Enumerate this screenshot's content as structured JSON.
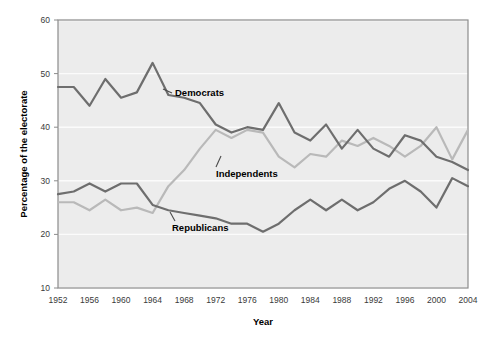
{
  "chart_data": {
    "type": "line",
    "title": "",
    "xlabel": "Year",
    "ylabel": "Percentage of the electorate",
    "xlim": [
      1952,
      2004
    ],
    "ylim": [
      10,
      60
    ],
    "yticks": [
      10,
      20,
      30,
      40,
      50,
      60
    ],
    "xticks": [
      1952,
      1956,
      1960,
      1964,
      1968,
      1972,
      1976,
      1980,
      1984,
      1988,
      1992,
      1996,
      2000,
      2004
    ],
    "grid": true,
    "legend_position": "inline-annotations",
    "colors": {
      "democrats": "#6e6e6e",
      "republicans": "#6e6e6e",
      "independents": "#b9b9b9",
      "plot_background": "#ececec",
      "gridline": "#fafafa",
      "frame": "#8c8c8c",
      "text": "#1a1a1a"
    },
    "x": [
      1952,
      1954,
      1956,
      1958,
      1960,
      1962,
      1964,
      1966,
      1968,
      1970,
      1972,
      1974,
      1976,
      1978,
      1980,
      1982,
      1984,
      1986,
      1988,
      1990,
      1992,
      1994,
      1996,
      1998,
      2000,
      2002,
      2004
    ],
    "series": [
      {
        "name": "Democrats",
        "label": "Democrats",
        "color": "#6e6e6e",
        "values": [
          47.5,
          47.5,
          44.0,
          49.0,
          45.5,
          46.5,
          52.0,
          46.0,
          45.5,
          44.5,
          40.5,
          39.0,
          40.0,
          39.5,
          44.5,
          39.0,
          37.5,
          40.5,
          36.0,
          39.5,
          36.0,
          34.5,
          38.5,
          37.5,
          34.5,
          33.5,
          32.0
        ]
      },
      {
        "name": "Independents",
        "label": "Independents",
        "color": "#b9b9b9",
        "values": [
          26.0,
          26.0,
          24.5,
          26.5,
          24.5,
          25.0,
          24.0,
          29.0,
          32.0,
          36.0,
          39.5,
          38.0,
          39.5,
          39.0,
          34.5,
          32.5,
          35.0,
          34.5,
          37.5,
          36.5,
          38.0,
          36.5,
          34.5,
          36.5,
          40.0,
          34.0,
          39.5
        ]
      },
      {
        "name": "Republicans",
        "label": "Republicans",
        "color": "#6e6e6e",
        "values": [
          27.5,
          28.0,
          29.5,
          28.0,
          29.5,
          29.5,
          25.5,
          24.5,
          24.0,
          23.5,
          23.0,
          22.0,
          22.0,
          20.5,
          22.0,
          24.5,
          26.5,
          24.5,
          26.5,
          24.5,
          26.0,
          28.5,
          30.0,
          28.0,
          25.0,
          30.5,
          29.0
        ]
      }
    ],
    "annotations": [
      {
        "name": "democrats-annotation",
        "label": "Democrats"
      },
      {
        "name": "independents-annotation",
        "label": "Independents"
      },
      {
        "name": "republicans-annotation",
        "label": "Republicans"
      }
    ]
  },
  "axes": {
    "y_title": "Percentage of the electorate",
    "x_title": "Year",
    "y_ticks": [
      "60",
      "50",
      "40",
      "30",
      "20",
      "10"
    ],
    "x_ticks": [
      "1952",
      "1956",
      "1960",
      "1964",
      "1968",
      "1972",
      "1976",
      "1980",
      "1984",
      "1988",
      "1992",
      "1996",
      "2000",
      "2004"
    ]
  },
  "labels": {
    "democrats": "Democrats",
    "independents": "Independents",
    "republicans": "Republicans"
  }
}
